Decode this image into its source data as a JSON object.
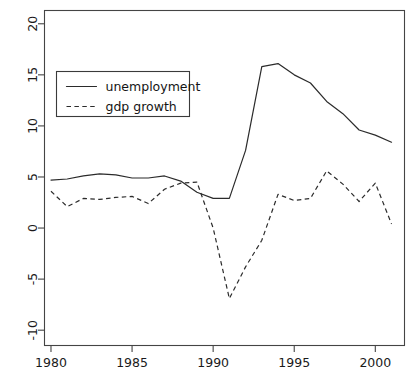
{
  "chart_data": {
    "type": "line",
    "title": "",
    "xlabel": "",
    "ylabel": "",
    "xlim": [
      1979.6,
      2001.8
    ],
    "ylim": [
      -11.5,
      21.3
    ],
    "grid": false,
    "legend_position": "top-left",
    "x_ticks": [
      "1980",
      "1985",
      "1990",
      "1995",
      "2000"
    ],
    "x_tick_values": [
      1980,
      1985,
      1990,
      1995,
      2000
    ],
    "y_ticks": [
      "20",
      "15",
      "10",
      "5",
      "0",
      "-5",
      "-10"
    ],
    "y_tick_values": [
      20,
      15,
      10,
      5,
      0,
      -5,
      -10
    ],
    "x": [
      1980,
      1981,
      1982,
      1983,
      1984,
      1985,
      1986,
      1987,
      1988,
      1989,
      1990,
      1991,
      1992,
      1993,
      1994,
      1995,
      1996,
      1997,
      1998,
      1999,
      2000,
      2001
    ],
    "series": [
      {
        "name": "unemployment",
        "style": "solid",
        "values": [
          4.7,
          4.8,
          5.1,
          5.3,
          5.2,
          4.9,
          4.9,
          5.1,
          4.6,
          3.5,
          2.9,
          2.9,
          7.6,
          15.8,
          16.1,
          15.0,
          14.2,
          12.4,
          11.2,
          9.6,
          9.1,
          8.4
        ]
      },
      {
        "name": "gdp growth",
        "style": "dashed",
        "values": [
          3.6,
          2.1,
          2.9,
          2.8,
          3.0,
          3.1,
          2.4,
          3.8,
          4.4,
          4.5,
          0.0,
          -6.9,
          -3.8,
          -1.2,
          3.3,
          2.7,
          2.9,
          5.6,
          4.3,
          2.6,
          4.4,
          0.4
        ]
      }
    ],
    "legend": [
      {
        "label": "unemployment",
        "style": "solid"
      },
      {
        "label": "gdp growth",
        "style": "dashed"
      }
    ]
  },
  "caption": ""
}
